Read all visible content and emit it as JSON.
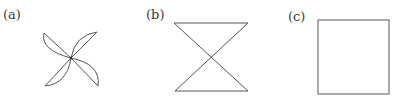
{
  "figures": [
    {
      "label": "(a)",
      "shape": "pinwheel-four-curved-petals"
    },
    {
      "label": "(b)",
      "shape": "hourglass-bowtie"
    },
    {
      "label": "(c)",
      "shape": "square"
    }
  ],
  "colors": {
    "stroke": "#555555",
    "label": "#3a3a3a",
    "background": "#ffffff"
  }
}
